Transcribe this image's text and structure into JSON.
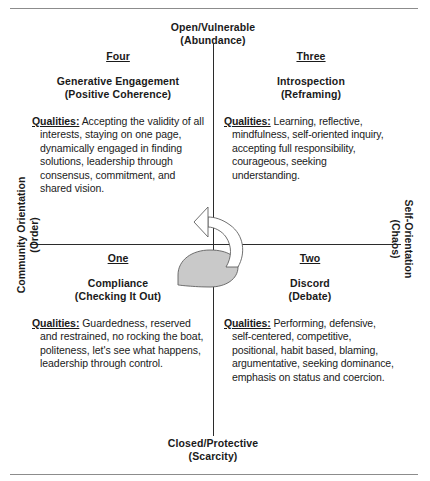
{
  "figure": {
    "clipped_top_caption": "",
    "poles": {
      "top": {
        "line1": "Open/Vulnerable",
        "line2": "(Abundance)"
      },
      "bottom": {
        "line1": "Closed/Protective",
        "line2": "(Scarcity)"
      },
      "left": {
        "line1": "Community Orientation",
        "line2": "(Order)"
      },
      "right": {
        "line1": "Self-Orientation",
        "line2": "(Chaos)"
      }
    },
    "quadrants": [
      {
        "id": "four",
        "number": "Four",
        "title_line1": "Generative Engagement",
        "title_line2": "(Positive Coherence)",
        "qualities_label": "Qualities:",
        "qualities_text": " Accepting the validity of all interests, staying on one page, dynamically engaged in finding solutions, leadership through consensus, commitment, and shared vision."
      },
      {
        "id": "three",
        "number": "Three",
        "title_line1": "Introspection",
        "title_line2": "(Reframing)",
        "qualities_label": "Qualities:",
        "qualities_text": " Learning, reflective, mindfulness, self-oriented inquiry, accepting full responsibility, courageous, seeking understanding."
      },
      {
        "id": "one",
        "number": "One",
        "title_line1": "Compliance",
        "title_line2": "(Checking It Out)",
        "qualities_label": "Qualities:",
        "qualities_text": " Guardedness, reserved and restrained, no rocking the boat, politeness, let's see what happens, leadership through control."
      },
      {
        "id": "two",
        "number": "Two",
        "title_line1": "Discord",
        "title_line2": "(Debate)",
        "qualities_label": "Qualities:",
        "qualities_text": " Performing, defensive, self-centered, competitive, positional, habit based, blaming, argumentative, seeking dominance, emphasis on status and coercion."
      }
    ],
    "arrow": {
      "name": "spiral-progression-arrow",
      "fill": "#c9c9c9",
      "stroke": "#555555"
    },
    "colors": {
      "axis": "#2b2b2b",
      "frame_rule": "#8c8c8c",
      "text": "#1a1a1a"
    }
  }
}
